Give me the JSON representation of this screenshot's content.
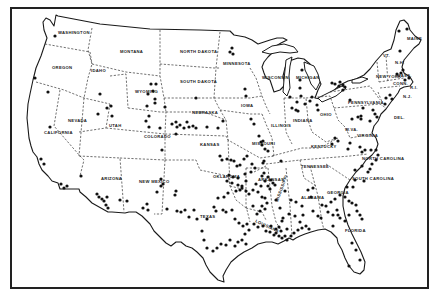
{
  "map": {
    "title": "",
    "frame_color": "#222222",
    "dot_color": "#111111",
    "states": [
      {
        "id": "wa",
        "label": "WASHINGTON",
        "x": 58,
        "y": 34
      },
      {
        "id": "or",
        "label": "OREGON",
        "x": 52,
        "y": 69
      },
      {
        "id": "id",
        "label": "IDAHO",
        "x": 91,
        "y": 72
      },
      {
        "id": "mt",
        "label": "MONTANA",
        "x": 120,
        "y": 53
      },
      {
        "id": "wy",
        "label": "WYOMING",
        "x": 135,
        "y": 93
      },
      {
        "id": "nd",
        "label": "NORTH DAKOTA",
        "x": 180,
        "y": 53
      },
      {
        "id": "sd",
        "label": "SOUTH DAKOTA",
        "x": 180,
        "y": 83
      },
      {
        "id": "ne",
        "label": "NEBRASKA",
        "x": 192,
        "y": 114
      },
      {
        "id": "mn",
        "label": "MINNESOTA",
        "x": 223,
        "y": 65
      },
      {
        "id": "ia",
        "label": "IOWA",
        "x": 241,
        "y": 107
      },
      {
        "id": "wi",
        "label": "WISCONSIN",
        "x": 262,
        "y": 79
      },
      {
        "id": "mi",
        "label": "MICHIGAN",
        "x": 296,
        "y": 79
      },
      {
        "id": "il",
        "label": "ILLINOIS",
        "x": 271,
        "y": 127
      },
      {
        "id": "in",
        "label": "INDIANA",
        "x": 293,
        "y": 122
      },
      {
        "id": "oh",
        "label": "OHIO",
        "x": 320,
        "y": 116
      },
      {
        "id": "pa",
        "label": "PENNSYLVANIA",
        "x": 348,
        "y": 104
      },
      {
        "id": "ny",
        "label": "NEW YORK",
        "x": 376,
        "y": 78
      },
      {
        "id": "me",
        "label": "MAINE",
        "x": 407,
        "y": 40
      },
      {
        "id": "vt",
        "label": "VT.",
        "x": 383,
        "y": 57
      },
      {
        "id": "nh",
        "label": "N.H.",
        "x": 395,
        "y": 64
      },
      {
        "id": "ma",
        "label": "MASS.",
        "x": 397,
        "y": 77
      },
      {
        "id": "ct",
        "label": "CONN.",
        "x": 393,
        "y": 85
      },
      {
        "id": "ri",
        "label": "R.I.",
        "x": 410,
        "y": 89
      },
      {
        "id": "nj",
        "label": "N.J.",
        "x": 403,
        "y": 98
      },
      {
        "id": "del",
        "label": "DEL.",
        "x": 394,
        "y": 119
      },
      {
        "id": "wv",
        "label": "W.VA.",
        "x": 345,
        "y": 131
      },
      {
        "id": "va",
        "label": "VIRGINIA",
        "x": 357,
        "y": 137
      },
      {
        "id": "ky",
        "label": "KENTUCKY",
        "x": 311,
        "y": 148
      },
      {
        "id": "tn",
        "label": "TENNESSEE",
        "x": 301,
        "y": 168
      },
      {
        "id": "nc",
        "label": "NORTH CAROLINA",
        "x": 362,
        "y": 160
      },
      {
        "id": "sc",
        "label": "SOUTH CAROLINA",
        "x": 352,
        "y": 180
      },
      {
        "id": "ga",
        "label": "GEORGIA",
        "x": 327,
        "y": 194
      },
      {
        "id": "al",
        "label": "ALABAMA",
        "x": 301,
        "y": 199
      },
      {
        "id": "ms",
        "label": "MISSISSIPPI",
        "x": 278,
        "y": 202
      },
      {
        "id": "la",
        "label": "LOUISIANA",
        "x": 255,
        "y": 222
      },
      {
        "id": "ar",
        "label": "ARKANSAS",
        "x": 258,
        "y": 181
      },
      {
        "id": "mo",
        "label": "MISSOURI",
        "x": 252,
        "y": 145
      },
      {
        "id": "ks",
        "label": "KANSAS",
        "x": 200,
        "y": 146
      },
      {
        "id": "ok",
        "label": "OKLAHOMA",
        "x": 213,
        "y": 178
      },
      {
        "id": "tx",
        "label": "TEXAS",
        "x": 200,
        "y": 218
      },
      {
        "id": "co",
        "label": "COLORADO",
        "x": 144,
        "y": 138
      },
      {
        "id": "nm",
        "label": "NEW MEXICO",
        "x": 139,
        "y": 183
      },
      {
        "id": "az",
        "label": "ARIZONA",
        "x": 101,
        "y": 180
      },
      {
        "id": "ut",
        "label": "UTAH",
        "x": 109,
        "y": 127
      },
      {
        "id": "nv",
        "label": "NEVADA",
        "x": 68,
        "y": 122
      },
      {
        "id": "ca",
        "label": "CALIFORNIA",
        "x": 44,
        "y": 134
      },
      {
        "id": "fl",
        "label": "FLORIDA",
        "x": 345,
        "y": 232
      }
    ],
    "dots": [
      [
        55,
        36
      ],
      [
        35,
        78
      ],
      [
        48,
        92
      ],
      [
        100,
        94
      ],
      [
        98,
        114
      ],
      [
        107,
        108
      ],
      [
        111,
        106
      ],
      [
        112,
        116
      ],
      [
        50,
        127
      ],
      [
        41,
        159
      ],
      [
        44,
        164
      ],
      [
        61,
        184
      ],
      [
        64,
        188
      ],
      [
        67,
        186
      ],
      [
        81,
        176
      ],
      [
        97,
        194
      ],
      [
        99,
        197
      ],
      [
        102,
        199
      ],
      [
        107,
        197
      ],
      [
        104,
        201
      ],
      [
        106,
        205
      ],
      [
        108,
        208
      ],
      [
        120,
        200
      ],
      [
        127,
        201
      ],
      [
        143,
        208
      ],
      [
        147,
        204
      ],
      [
        148,
        210
      ],
      [
        151,
        84
      ],
      [
        156,
        84
      ],
      [
        148,
        94
      ],
      [
        153,
        91
      ],
      [
        155,
        99
      ],
      [
        147,
        106
      ],
      [
        155,
        103
      ],
      [
        149,
        116
      ],
      [
        146,
        121
      ],
      [
        149,
        127
      ],
      [
        160,
        128
      ],
      [
        172,
        124
      ],
      [
        176,
        122
      ],
      [
        177,
        127
      ],
      [
        180,
        125
      ],
      [
        184,
        128
      ],
      [
        187,
        122
      ],
      [
        189,
        127
      ],
      [
        193,
        126
      ],
      [
        196,
        128
      ],
      [
        207,
        127
      ],
      [
        218,
        128
      ],
      [
        223,
        121
      ],
      [
        162,
        150
      ],
      [
        176,
        134
      ],
      [
        165,
        107
      ],
      [
        196,
        98
      ],
      [
        230,
        52
      ],
      [
        232,
        48
      ],
      [
        233,
        54
      ],
      [
        246,
        96
      ],
      [
        245,
        89
      ],
      [
        251,
        119
      ],
      [
        254,
        124
      ],
      [
        259,
        136
      ],
      [
        261,
        142
      ],
      [
        262,
        145
      ],
      [
        263,
        141
      ],
      [
        265,
        149
      ],
      [
        268,
        151
      ],
      [
        290,
        97
      ],
      [
        292,
        108
      ],
      [
        297,
        102
      ],
      [
        296,
        110
      ],
      [
        263,
        163
      ],
      [
        264,
        161
      ],
      [
        281,
        161
      ],
      [
        298,
        111
      ],
      [
        302,
        70
      ],
      [
        300,
        80
      ],
      [
        300,
        88
      ],
      [
        301,
        96
      ],
      [
        305,
        104
      ],
      [
        310,
        101
      ],
      [
        312,
        97
      ],
      [
        317,
        105
      ],
      [
        318,
        110
      ],
      [
        332,
        83
      ],
      [
        335,
        84
      ],
      [
        339,
        86
      ],
      [
        340,
        82
      ],
      [
        343,
        85
      ],
      [
        345,
        87
      ],
      [
        343,
        90
      ],
      [
        350,
        100
      ],
      [
        363,
        108
      ],
      [
        361,
        116
      ],
      [
        352,
        119
      ],
      [
        358,
        117
      ],
      [
        361,
        119
      ],
      [
        370,
        121
      ],
      [
        373,
        110
      ],
      [
        375,
        114
      ],
      [
        377,
        117
      ],
      [
        385,
        104
      ],
      [
        386,
        98
      ],
      [
        390,
        95
      ],
      [
        392,
        99
      ],
      [
        397,
        74
      ],
      [
        401,
        73
      ],
      [
        403,
        70
      ],
      [
        405,
        80
      ],
      [
        409,
        78
      ],
      [
        400,
        51
      ],
      [
        399,
        31
      ],
      [
        407,
        29
      ],
      [
        332,
        144
      ],
      [
        335,
        138
      ],
      [
        338,
        141
      ],
      [
        350,
        143
      ],
      [
        348,
        149
      ],
      [
        360,
        147
      ],
      [
        362,
        152
      ],
      [
        365,
        150
      ],
      [
        371,
        150
      ],
      [
        376,
        150
      ],
      [
        378,
        155
      ],
      [
        376,
        160
      ],
      [
        372,
        164
      ],
      [
        368,
        172
      ],
      [
        362,
        166
      ],
      [
        355,
        170
      ],
      [
        355,
        180
      ],
      [
        347,
        187
      ],
      [
        353,
        187
      ],
      [
        364,
        181
      ],
      [
        370,
        169
      ],
      [
        352,
        203
      ],
      [
        356,
        205
      ],
      [
        357,
        211
      ],
      [
        360,
        215
      ],
      [
        362,
        219
      ],
      [
        345,
        197
      ],
      [
        349,
        201
      ],
      [
        340,
        195
      ],
      [
        335,
        199
      ],
      [
        331,
        202
      ],
      [
        328,
        212
      ],
      [
        333,
        215
      ],
      [
        338,
        215
      ],
      [
        340,
        218
      ],
      [
        345,
        221
      ],
      [
        349,
        215
      ],
      [
        333,
        226
      ],
      [
        313,
        211
      ],
      [
        318,
        216
      ],
      [
        326,
        206
      ],
      [
        308,
        190
      ],
      [
        313,
        188
      ],
      [
        311,
        197
      ],
      [
        322,
        205
      ],
      [
        337,
        210
      ],
      [
        321,
        218
      ],
      [
        352,
        243
      ],
      [
        356,
        250
      ],
      [
        349,
        266
      ],
      [
        360,
        260
      ],
      [
        285,
        191
      ],
      [
        291,
        200
      ],
      [
        296,
        202
      ],
      [
        302,
        206
      ],
      [
        303,
        215
      ],
      [
        295,
        216
      ],
      [
        289,
        214
      ],
      [
        282,
        221
      ],
      [
        279,
        227
      ],
      [
        281,
        231
      ],
      [
        276,
        229
      ],
      [
        271,
        226
      ],
      [
        287,
        229
      ],
      [
        280,
        208
      ],
      [
        276,
        200
      ],
      [
        270,
        189
      ],
      [
        271,
        180
      ],
      [
        273,
        183
      ],
      [
        275,
        185
      ],
      [
        268,
        177
      ],
      [
        264,
        173
      ],
      [
        262,
        176
      ],
      [
        265,
        181
      ],
      [
        268,
        186
      ],
      [
        261,
        186
      ],
      [
        256,
        184
      ],
      [
        253,
        190
      ],
      [
        258,
        192
      ],
      [
        262,
        197
      ],
      [
        265,
        198
      ],
      [
        267,
        203
      ],
      [
        262,
        206
      ],
      [
        265,
        209
      ],
      [
        260,
        211
      ],
      [
        257,
        214
      ],
      [
        253,
        206
      ],
      [
        249,
        194
      ],
      [
        246,
        191
      ],
      [
        242,
        186
      ],
      [
        246,
        181
      ],
      [
        245,
        174
      ],
      [
        251,
        172
      ],
      [
        255,
        168
      ],
      [
        252,
        164
      ],
      [
        247,
        156
      ],
      [
        244,
        159
      ],
      [
        220,
        156
      ],
      [
        222,
        160
      ],
      [
        227,
        159
      ],
      [
        231,
        160
      ],
      [
        234,
        161
      ],
      [
        237,
        166
      ],
      [
        240,
        165
      ],
      [
        229,
        175
      ],
      [
        233,
        177
      ],
      [
        238,
        178
      ],
      [
        227,
        181
      ],
      [
        232,
        183
      ],
      [
        238,
        185
      ],
      [
        240,
        190
      ],
      [
        242,
        188
      ],
      [
        236,
        191
      ],
      [
        228,
        193
      ],
      [
        224,
        197
      ],
      [
        218,
        198
      ],
      [
        214,
        207
      ],
      [
        216,
        211
      ],
      [
        223,
        210
      ],
      [
        226,
        212
      ],
      [
        232,
        210
      ],
      [
        235,
        219
      ],
      [
        239,
        223
      ],
      [
        243,
        226
      ],
      [
        247,
        224
      ],
      [
        249,
        230
      ],
      [
        245,
        234
      ],
      [
        242,
        240
      ],
      [
        238,
        242
      ],
      [
        235,
        246
      ],
      [
        230,
        240
      ],
      [
        226,
        245
      ],
      [
        221,
        244
      ],
      [
        217,
        248
      ],
      [
        213,
        251
      ],
      [
        207,
        248
      ],
      [
        204,
        240
      ],
      [
        202,
        231
      ],
      [
        207,
        219
      ],
      [
        197,
        219
      ],
      [
        194,
        210
      ],
      [
        189,
        217
      ],
      [
        185,
        210
      ],
      [
        181,
        212
      ],
      [
        177,
        211
      ],
      [
        167,
        209
      ],
      [
        175,
        195
      ],
      [
        176,
        191
      ],
      [
        163,
        184
      ],
      [
        157,
        192
      ],
      [
        161,
        186
      ],
      [
        161,
        179
      ],
      [
        254,
        224
      ],
      [
        258,
        227
      ],
      [
        263,
        226
      ],
      [
        266,
        231
      ],
      [
        270,
        232
      ],
      [
        274,
        235
      ],
      [
        276,
        233
      ],
      [
        279,
        236
      ],
      [
        282,
        238
      ],
      [
        285,
        236
      ],
      [
        287,
        240
      ],
      [
        291,
        236
      ],
      [
        294,
        233
      ],
      [
        298,
        230
      ],
      [
        302,
        228
      ],
      [
        306,
        226
      ],
      [
        309,
        229
      ],
      [
        300,
        222
      ],
      [
        283,
        218
      ],
      [
        246,
        244
      ]
    ]
  }
}
